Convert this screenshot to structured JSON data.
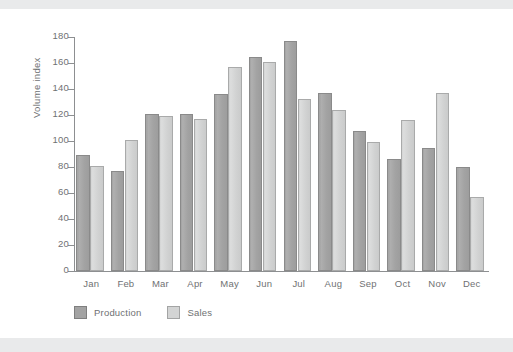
{
  "chart_data": {
    "type": "bar",
    "title": "",
    "subtitle": "",
    "xlabel": "",
    "ylabel": "Volume index",
    "categories": [
      "Jan",
      "Feb",
      "Mar",
      "Apr",
      "May",
      "Jun",
      "Jul",
      "Aug",
      "Sep",
      "Oct",
      "Nov",
      "Dec"
    ],
    "series": [
      {
        "name": "Production",
        "color": "#a3a3a3",
        "values": [
          89,
          77,
          121,
          121,
          136,
          165,
          177,
          137,
          108,
          86,
          95,
          80
        ]
      },
      {
        "name": "Sales",
        "color": "#d3d4d4",
        "values": [
          81,
          101,
          119,
          117,
          157,
          161,
          132,
          124,
          99,
          116,
          137,
          57
        ]
      }
    ],
    "ylim": [
      0,
      180
    ],
    "ytick_step": 20,
    "yticks": [
      0,
      20,
      40,
      60,
      80,
      100,
      120,
      140,
      160,
      180
    ],
    "grid": false,
    "legend_position": "bottom-left",
    "annotations": []
  },
  "legend": {
    "items": [
      {
        "label": "Production",
        "swatch": "production-swatch"
      },
      {
        "label": "Sales",
        "swatch": "sales-swatch"
      }
    ]
  },
  "axes": {
    "y_title": "Volume index"
  },
  "colors": {
    "production": "#a3a3a3",
    "sales": "#d3d4d4",
    "axis": "#8d8f91",
    "text": "#6f7173",
    "background": "#ffffff",
    "band": "#e9eaeb"
  }
}
